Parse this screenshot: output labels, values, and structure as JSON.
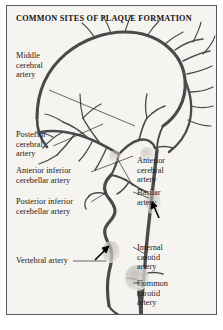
{
  "figure": {
    "title": "COMMON SITES OF PLAQUE FORMATION",
    "background_color": "#f6f4f1",
    "border_color": "#5a5a5a",
    "vessel_color": "#4a4a4a",
    "text_color": "#1a1a1a",
    "arrow_color": "#000000"
  },
  "labels": {
    "middle_cerebral_artery": "Middle\ncerebral\nartery",
    "posterior_cerebral_artery": "Posterior\ncerebral\nartery",
    "anterior_inferior_cerebellar_artery": "Anterior inferior\ncerebellar artery",
    "posterior_inferior_cerebellar_artery": "Posterior inferior\ncerebellar artery",
    "vertebral_artery": "Vertebral artery",
    "anterior_cerebral_artery": "Anterior\ncerebral\nartery",
    "basilar_artery": "Basilar\nartery",
    "internal_carotid_artery": "Internal\ncarotid\nartery",
    "common_carotid_artery": "Common\ncarotid\nartery"
  },
  "plaque_markers": [
    {
      "name": "vertebral-artery-plaque-arrow"
    },
    {
      "name": "basilar-artery-plaque-arrow"
    },
    {
      "name": "carotid-bifurcation-plaque"
    }
  ]
}
